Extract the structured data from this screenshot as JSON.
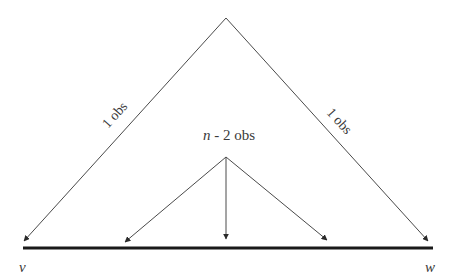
{
  "diagram": {
    "type": "flow-tree",
    "colors": {
      "line": "#4a4a4a",
      "baseline": "#1a1a1a",
      "text": "#3a3a3a",
      "background": "#ffffff"
    },
    "nodes": {
      "apex": {
        "x": 226,
        "y": 18
      },
      "inner_origin": {
        "x": 226,
        "y": 157
      }
    },
    "endpoints": {
      "v": {
        "label": "v",
        "x": 24,
        "y": 241
      },
      "w": {
        "label": "w",
        "x": 428,
        "y": 241
      }
    },
    "edges": [
      {
        "from": "apex",
        "to": "v",
        "label": "1 obs"
      },
      {
        "from": "apex",
        "to": "w",
        "label": "1 obs"
      },
      {
        "from": "inner_origin",
        "to": "baseline-left",
        "label": ""
      },
      {
        "from": "inner_origin",
        "to": "baseline-center",
        "label": ""
      },
      {
        "from": "inner_origin",
        "to": "baseline-right",
        "label": ""
      }
    ],
    "labels": {
      "left_edge": "1 obs",
      "right_edge": "1 obs",
      "center_n": "n",
      "center_rest": " - 2 obs",
      "left_end": "v",
      "right_end": "w"
    },
    "baseline": {
      "x1": 23,
      "x2": 433,
      "y": 248
    }
  }
}
